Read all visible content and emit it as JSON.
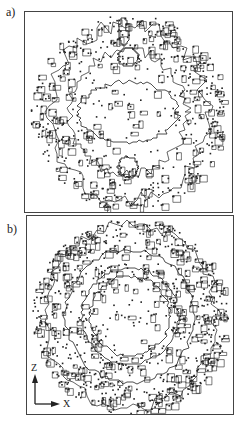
{
  "figure": {
    "panels": [
      {
        "id": "a",
        "label": "a)",
        "pattern": "two-lobed rings with dense speckled contour band and two small inner closed loops (top and bottom)"
      },
      {
        "id": "b",
        "label": "b)",
        "pattern": "concentric ring contours with dense speckled outer band and sparse interior"
      }
    ],
    "axes": {
      "vertical": "Z",
      "horizontal": "X"
    },
    "colors": {
      "ink": "#222222",
      "frame": "#444444",
      "background": "#ffffff"
    }
  }
}
